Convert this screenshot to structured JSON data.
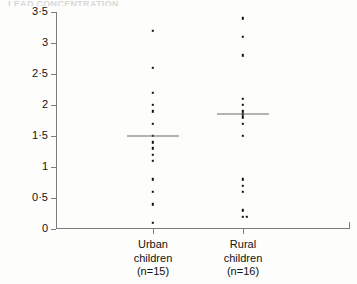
{
  "figure": {
    "caption_remnant": "LEAD  CONCENTRATION"
  },
  "chart_data": {
    "type": "scatter",
    "plot_style": "dot-strip-plot",
    "title": "",
    "subtitle": "",
    "xlabel": "",
    "ylabel": "Lead concentration (µmol/24 h)",
    "ylim": [
      0,
      3.5
    ],
    "yticks": [
      0,
      0.5,
      1,
      1.5,
      2,
      2.5,
      3,
      3.5
    ],
    "ytick_labels": [
      "0",
      "0·5",
      "1",
      "1·5",
      "2",
      "2·5",
      "3",
      "3·5"
    ],
    "grid": false,
    "legend": "none",
    "decimal_separator": "middle-dot",
    "categories": [
      "Urban children",
      "Rural children"
    ],
    "groups": [
      {
        "name": "Urban children",
        "label_line1": "Urban",
        "label_line2": "children",
        "label_line3": "(n=15)",
        "n": 15,
        "median": 1.5,
        "values": [
          3.2,
          2.6,
          2.2,
          2.0,
          1.9,
          1.7,
          1.5,
          1.4,
          1.3,
          1.2,
          1.1,
          0.8,
          0.6,
          0.4,
          0.1
        ]
      },
      {
        "name": "Rural children",
        "label_line1": "Rural",
        "label_line2": "children",
        "label_line3": "(n=16)",
        "n": 16,
        "median": 1.85,
        "values": [
          3.4,
          3.1,
          2.8,
          2.1,
          2.0,
          1.9,
          1.85,
          1.8,
          1.7,
          1.5,
          0.8,
          0.7,
          0.6,
          0.3,
          0.2,
          0.2
        ]
      }
    ]
  }
}
